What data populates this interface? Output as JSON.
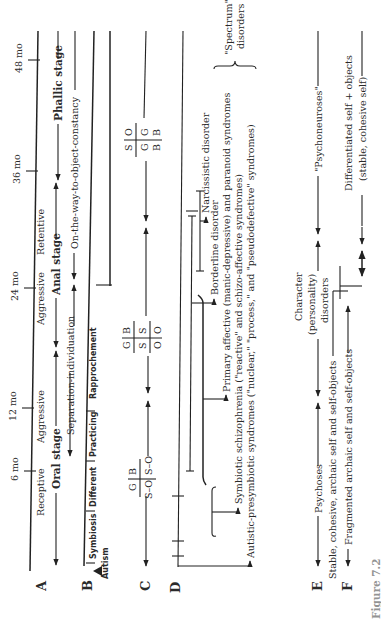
{
  "time_axis": {
    "ticks": [
      "6 mo",
      "12 mo",
      "24 mo",
      "36 mo",
      "48 mo"
    ]
  },
  "rows": {
    "A": {
      "label": "A",
      "oral_stage": "Oral stage",
      "receptive": "Receptive",
      "aggressive_oral": "Aggressive",
      "anal_stage": "Anal stage",
      "aggressive_anal": "Aggressive",
      "retentive": "Retentive",
      "phallic_stage": "Phallic stage"
    },
    "B": {
      "label": "B",
      "separation_individuation": "Separation-individuation",
      "object_constancy": "On-the-way-to-object-constancy",
      "autism": "Autism",
      "subphases": [
        "Symbiosis",
        "Different",
        "Practicing",
        "Rapprochement"
      ]
    },
    "C": {
      "label": "C",
      "box1": {
        "top": [
          "G",
          "B"
        ],
        "bottom": [
          "S–O",
          "S–O"
        ]
      },
      "box2": {
        "top": [
          "G",
          "B"
        ],
        "mid": [
          "S",
          "S"
        ],
        "bottom": [
          "O",
          "O"
        ]
      },
      "box3": {
        "top": [
          "S",
          "O"
        ],
        "mid": [
          "G",
          "G"
        ],
        "bottom": [
          "B",
          "B"
        ]
      }
    },
    "D": {
      "label": "D",
      "items": [
        "Narcissistic disorder",
        "Borderline disorder",
        "Primary affective (manic-depressive) and paranoid syndromes",
        "Symbiotic schizophrenia (\"reactive\" and schizo-affective syndromes)",
        "Autistic-presymbiotic syndromes (\"nuclear,\" \"process,\" and \"pseudodefective\" syndromes)"
      ],
      "spectrum_line1": "\"Spectrum\"",
      "spectrum_line2": "disorders"
    },
    "E": {
      "label": "E",
      "psychoses": "Psychoses",
      "character_line1": "Character",
      "character_line2": "(personality)",
      "character_line3": "disorders",
      "psychoneuroses": "\"Psychoneuroses\""
    },
    "F": {
      "label": "F",
      "fragmented": "Fragmented archaic self and self-objects",
      "stable_cohesive": "Stable, cohesive, archaic self and self-objects",
      "differentiated_line1": "Differentiated self + objects",
      "differentiated_line2": "(stable, cohesive self)"
    }
  },
  "caption": "Figure 7.2"
}
